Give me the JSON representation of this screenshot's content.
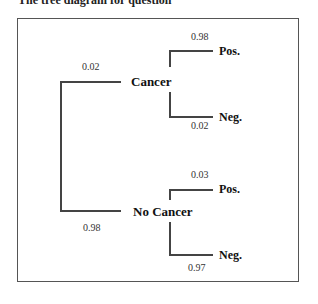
{
  "caption": "The tree diagram for question",
  "tree": {
    "root_branches": [
      {
        "label": "Cancer",
        "probability": "0.02",
        "children": [
          {
            "label": "Pos.",
            "probability": "0.98"
          },
          {
            "label": "Neg.",
            "probability": "0.02"
          }
        ]
      },
      {
        "label": "No Cancer",
        "probability": "0.98",
        "children": [
          {
            "label": "Pos.",
            "probability": "0.03"
          },
          {
            "label": "Neg.",
            "probability": "0.97"
          }
        ]
      }
    ]
  }
}
